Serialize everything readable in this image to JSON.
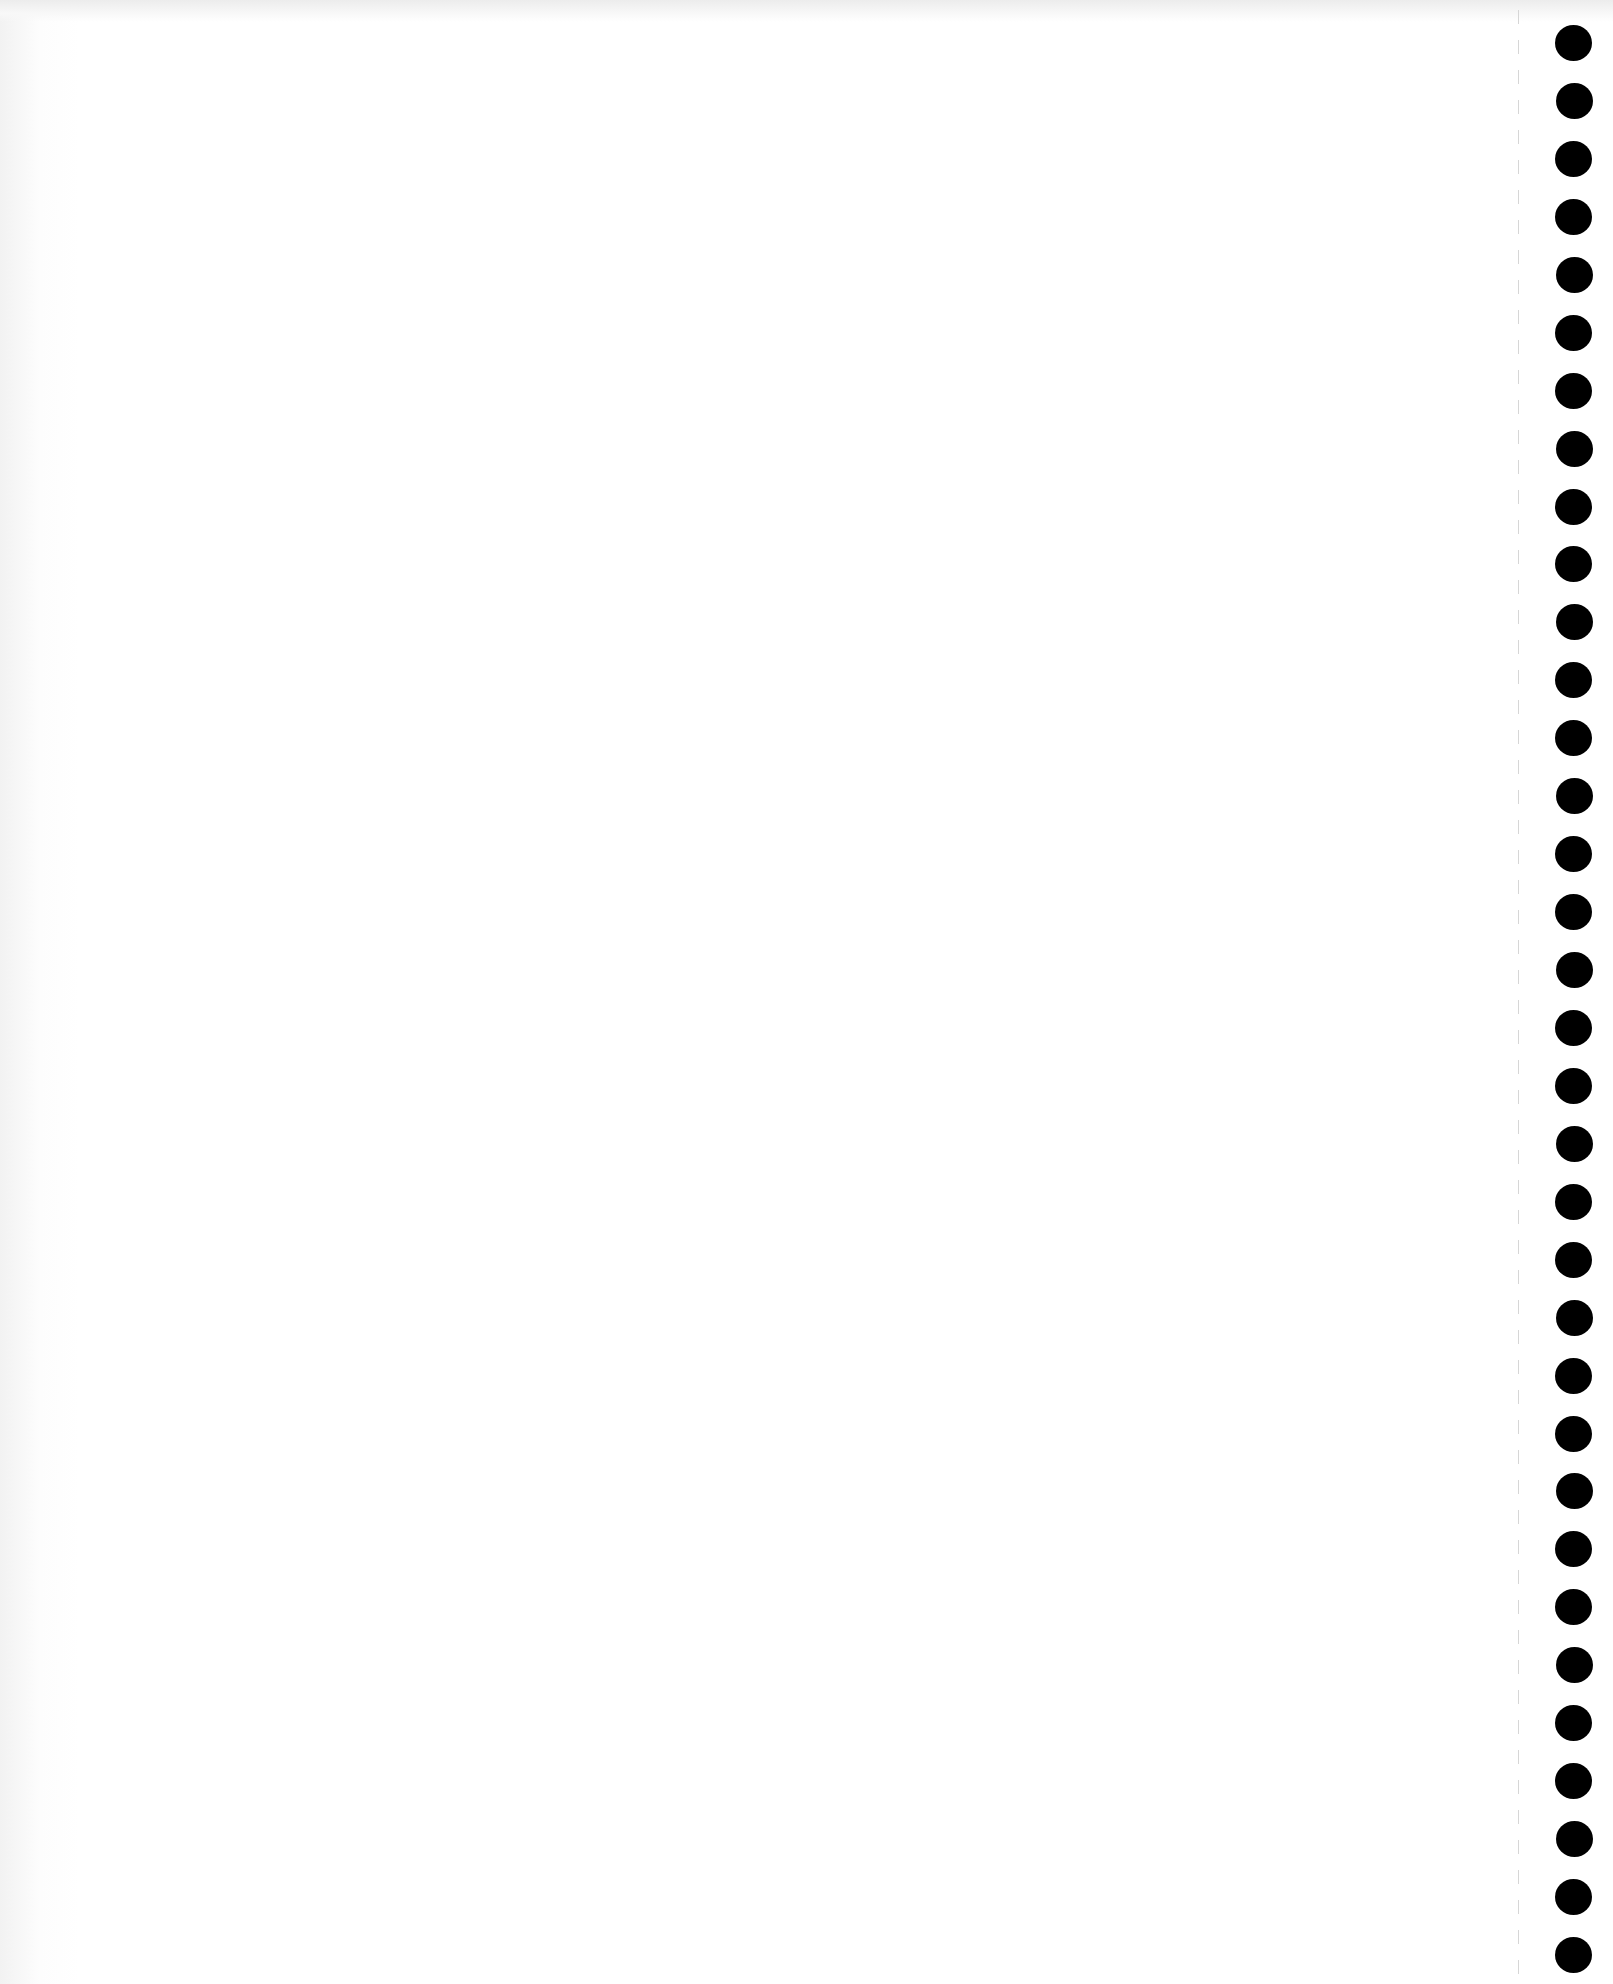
{
  "page": {
    "type": "blank scanned page",
    "background_color": "#ffffff",
    "binding": {
      "side": "right",
      "hole_count": 34,
      "hole_color": "#000000",
      "perforation_line": true
    }
  }
}
